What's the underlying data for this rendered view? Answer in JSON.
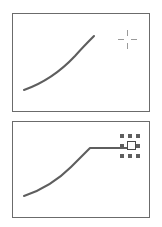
{
  "figure": {
    "background_color": "#ffffff",
    "width": 162,
    "height": 227,
    "stroke_color": "#5e5e5e",
    "border_color": "#6b6b6b",
    "cursor_color": "#9a9a9a",
    "handle_color": "#5e5e5e",
    "node_fill": "#ffffff"
  },
  "panels": [
    {
      "id": "panel-top",
      "name": "before-panel",
      "caption": "",
      "frame": {
        "x": 12,
        "y": 13,
        "width": 138,
        "height": 99
      },
      "curve": {
        "name": "rising-curve",
        "path": "M 11,76 C 28,70 47,58 62,42 C 70,33 76,27 81,22",
        "description": "concave-up rising curve from lower-left to upper-right"
      },
      "tail": null,
      "cursor": {
        "name": "crosshair-cursor",
        "type": "crosshair",
        "x": 117,
        "y": 29,
        "size": 19,
        "gap": 7
      },
      "selection": null
    },
    {
      "id": "panel-bottom",
      "name": "after-panel",
      "caption": "",
      "frame": {
        "x": 12,
        "y": 121,
        "width": 138,
        "height": 97
      },
      "curve": {
        "name": "rising-curve-flattened",
        "path": "M 11,74 C 26,69 43,60 58,45 C 66,37 72,31 77,26",
        "description": "curve rising from lower-left, flattening into a horizontal tail"
      },
      "tail": {
        "name": "horizontal-extension",
        "path": "M 77,26 L 120,26",
        "description": "straight horizontal segment extending right to the selected node"
      },
      "cursor": null,
      "selection": {
        "name": "node-selection-handles",
        "x": 118,
        "y": 133,
        "handle_count": 8,
        "handle_size": 4,
        "node_size": 9,
        "handles": [
          "nw",
          "n",
          "ne",
          "w",
          "e",
          "sw",
          "s",
          "se"
        ]
      }
    }
  ]
}
